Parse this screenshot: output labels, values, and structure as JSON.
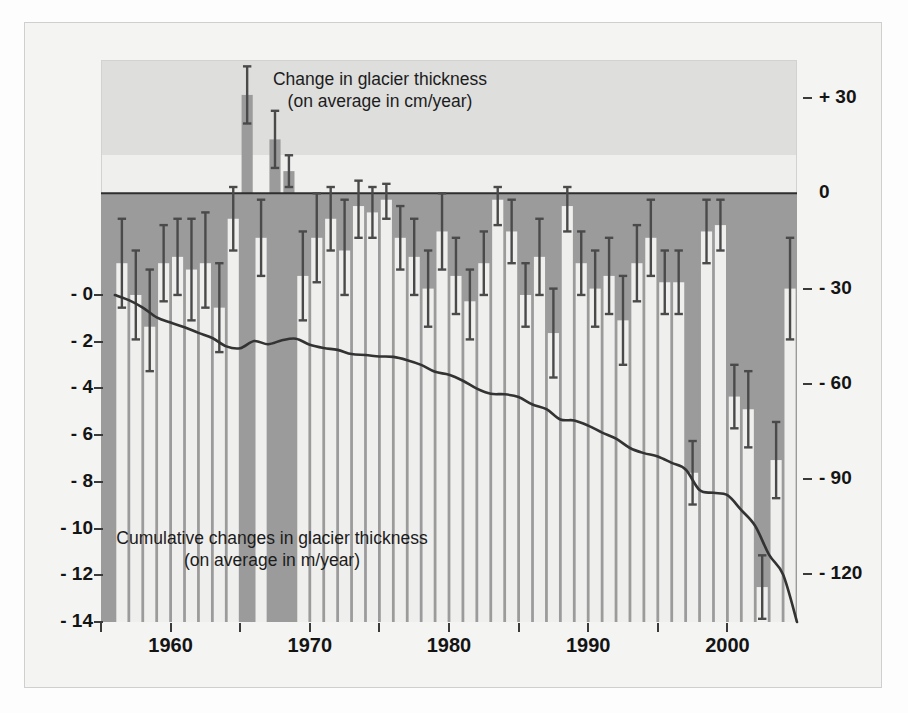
{
  "figure": {
    "top_title_line1": "Change in glacier thickness",
    "top_title_line2": "(on average in cm/year)",
    "bottom_title_line1": "Cumulative changes in glacier thickness",
    "bottom_title_line2": "(on average in m/year)"
  },
  "colors": {
    "bar_fill": "#9b9b9b",
    "negative_band": "#9b9b9b",
    "upper_band_bg": "#dededd",
    "lower_band_bg": "#efefee",
    "error_bar": "#4a4a4a",
    "line": "#333333",
    "text": "#141414",
    "frame": "#cfcfcf"
  },
  "axes": {
    "x": {
      "label": "",
      "major_ticks": [
        "1960",
        "1970",
        "1980",
        "1990",
        "2000"
      ],
      "major_tick_values": [
        1960,
        1970,
        1980,
        1990,
        2000
      ],
      "minor_tick_values": [
        1955,
        1965,
        1975,
        1985,
        1995,
        2005
      ],
      "range": [
        1955.0,
        2005.0
      ]
    },
    "y_right": {
      "label": "cm/year",
      "ticks": [
        "+ 30",
        "0",
        "- 30",
        "- 60",
        "- 90",
        "- 120"
      ],
      "tick_values": [
        30,
        0,
        -30,
        -60,
        -90,
        -120
      ],
      "range": [
        -135,
        42
      ]
    },
    "y_left": {
      "label": "m",
      "ticks": [
        "- 0",
        "- 2",
        "- 4",
        "- 6",
        "- 8",
        "- 10",
        "- 12",
        "- 14"
      ],
      "tick_values": [
        0,
        -2,
        -4,
        -6,
        -8,
        -10,
        -12,
        -14
      ],
      "range": [
        -14,
        0
      ]
    }
  },
  "chart_data": {
    "type": "bar",
    "title": "Change in glacier thickness (on average in cm/year)",
    "subtitle": "Cumulative changes in glacier thickness (on average in m/year)",
    "xlabel": "Year",
    "ylabel": "Change in glacier thickness (cm/year)",
    "ylabel_secondary": "Cumulative change in glacier thickness (m)",
    "ylim": [
      -135,
      42
    ],
    "ylim_secondary": [
      -14,
      0
    ],
    "xlim": [
      1955.0,
      2005.0
    ],
    "grid": false,
    "legend": "none",
    "x": [
      1956,
      1957,
      1958,
      1959,
      1960,
      1961,
      1962,
      1963,
      1964,
      1965,
      1966,
      1967,
      1968,
      1969,
      1970,
      1971,
      1972,
      1973,
      1974,
      1975,
      1976,
      1977,
      1978,
      1979,
      1980,
      1981,
      1982,
      1983,
      1984,
      1985,
      1986,
      1987,
      1988,
      1989,
      1990,
      1991,
      1992,
      1993,
      1994,
      1995,
      1996,
      1997,
      1998,
      1999,
      2000,
      2001,
      2002,
      2003,
      2004
    ],
    "series": [
      {
        "name": "Annual change in glacier thickness (cm/year)",
        "type": "bar",
        "units": "cm/year",
        "values": [
          -22,
          -32,
          -42,
          -22,
          -20,
          -24,
          -22,
          -36,
          -8,
          31,
          -14,
          17,
          7,
          -26,
          -14,
          -8,
          -18,
          -4,
          -6,
          -2,
          -14,
          -20,
          -30,
          -12,
          -26,
          -34,
          -22,
          -2,
          -12,
          -32,
          -20,
          -44,
          -4,
          -22,
          -30,
          -26,
          -40,
          -22,
          -14,
          -28,
          -28,
          -88,
          -12,
          -10,
          -64,
          -68,
          -124,
          -84,
          -30
        ],
        "error_upper": [
          -8,
          -18,
          -24,
          -10,
          -8,
          -8,
          -6,
          -22,
          2,
          40,
          -2,
          26,
          12,
          -12,
          0,
          2,
          -2,
          4,
          2,
          3,
          -4,
          -8,
          -18,
          0,
          -14,
          -24,
          -12,
          2,
          -2,
          -22,
          -8,
          -30,
          2,
          -12,
          -18,
          -14,
          -26,
          -10,
          -2,
          -18,
          -18,
          -78,
          -2,
          -2,
          -54,
          -56,
          -114,
          -72,
          -14
        ],
        "error_lower": [
          -36,
          -46,
          -56,
          -34,
          -32,
          -40,
          -36,
          -50,
          -18,
          22,
          -26,
          8,
          2,
          -40,
          -28,
          -18,
          -32,
          -14,
          -14,
          -8,
          -24,
          -32,
          -42,
          -24,
          -38,
          -46,
          -32,
          -10,
          -22,
          -42,
          -32,
          -58,
          -12,
          -32,
          -42,
          -38,
          -54,
          -34,
          -26,
          -38,
          -38,
          -98,
          -22,
          -18,
          -74,
          -80,
          -134,
          -96,
          -46
        ]
      },
      {
        "name": "Cumulative change in glacier thickness (m)",
        "type": "line",
        "units": "m",
        "values": [
          0.0,
          -0.22,
          -0.54,
          -0.96,
          -1.18,
          -1.38,
          -1.62,
          -1.84,
          -2.2,
          -2.28,
          -1.97,
          -2.11,
          -1.94,
          -1.87,
          -2.13,
          -2.27,
          -2.35,
          -2.53,
          -2.57,
          -2.63,
          -2.65,
          -2.79,
          -2.99,
          -3.29,
          -3.41,
          -3.67,
          -4.01,
          -4.23,
          -4.25,
          -4.37,
          -4.69,
          -4.89,
          -5.33,
          -5.37,
          -5.59,
          -5.89,
          -6.15,
          -6.55,
          -6.77,
          -6.91,
          -7.19,
          -7.47,
          -8.35,
          -8.47,
          -8.57,
          -9.21,
          -9.89,
          -11.13,
          -11.97
        ]
      }
    ]
  }
}
